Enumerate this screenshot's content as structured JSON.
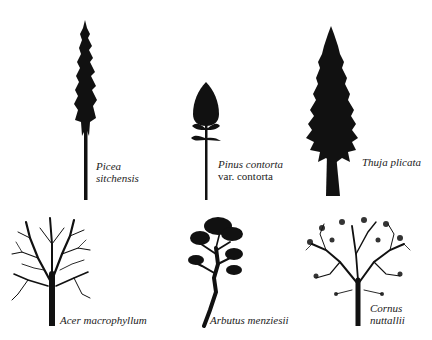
{
  "figure": {
    "trees": [
      {
        "id": "picea",
        "label_lines": [
          "Picea",
          "sitchensis"
        ],
        "habit": "conifer-tall-narrow"
      },
      {
        "id": "pinus",
        "label_lines": [
          "Pinus contorta",
          "var. contorta"
        ],
        "habit": "conifer-small-crown"
      },
      {
        "id": "thuja",
        "label_lines": [
          "Thuja plicata"
        ],
        "habit": "conifer-broad"
      },
      {
        "id": "acer",
        "label_lines": [
          "Acer macrophyllum"
        ],
        "habit": "broadleaf-rounded"
      },
      {
        "id": "arbutus",
        "label_lines": [
          "Arbutus menziesii"
        ],
        "habit": "broadleaf-irregular"
      },
      {
        "id": "cornus",
        "label_lines": [
          "Cornus",
          "nuttallii"
        ],
        "habit": "broadleaf-spreading"
      }
    ],
    "ink_color": "#111111",
    "background": "#ffffff"
  }
}
